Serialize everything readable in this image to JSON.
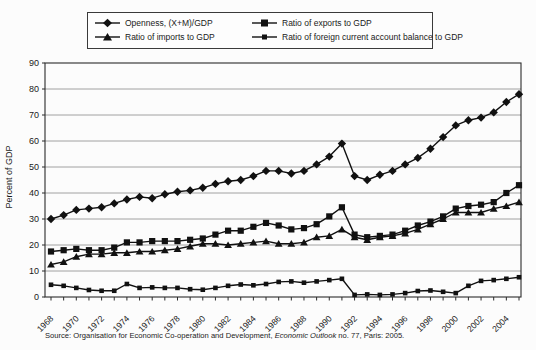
{
  "legend": {
    "items": [
      {
        "label": "Openness, (X+M)/GDP",
        "marker": "diamond"
      },
      {
        "label": "Ratio of exports to GDP",
        "marker": "square"
      },
      {
        "label": "Ratio of imports to GDP",
        "marker": "triangle"
      },
      {
        "label": "Ratio of foreign current account balance to GDP",
        "marker": "small-square"
      }
    ]
  },
  "chart_data": {
    "type": "line",
    "title": "",
    "xlabel": "",
    "ylabel": "Percent of GDP",
    "ylim": [
      0,
      90
    ],
    "ytick_interval": 10,
    "grid": "horizontal",
    "legend_position": "top",
    "line_color": "#111111",
    "grid_color": "#8a8a8a",
    "frame_color": "#2b2b2b",
    "x": [
      1968,
      1969,
      1970,
      1971,
      1972,
      1973,
      1974,
      1975,
      1976,
      1977,
      1978,
      1979,
      1980,
      1981,
      1982,
      1983,
      1984,
      1985,
      1986,
      1987,
      1988,
      1989,
      1990,
      1991,
      1992,
      1993,
      1994,
      1995,
      1996,
      1997,
      1998,
      1999,
      2000,
      2001,
      2002,
      2003,
      2004,
      2005
    ],
    "xtick_labels": [
      "1968",
      "1970",
      "1972",
      "1974",
      "1976",
      "1978",
      "1980",
      "1982",
      "1984",
      "1986",
      "1988",
      "1990",
      "1992",
      "1994",
      "1996",
      "1998",
      "2000",
      "2002",
      "2004"
    ],
    "series": [
      {
        "name": "Openness, (X+M)/GDP",
        "marker": "diamond",
        "color": "#111111",
        "values": [
          30,
          31.5,
          33.5,
          34,
          34.5,
          36,
          37.5,
          38.5,
          38,
          39.5,
          40.5,
          41,
          42,
          43.5,
          44.5,
          45,
          46.5,
          48.5,
          48.5,
          47.5,
          48.5,
          51,
          54,
          59,
          46.5,
          45,
          47,
          48.5,
          51,
          53.5,
          57,
          61.5,
          66,
          68,
          69,
          71,
          75,
          78
        ]
      },
      {
        "name": "Ratio of exports to GDP",
        "marker": "square",
        "color": "#111111",
        "values": [
          17.5,
          18,
          18.5,
          18,
          18,
          19,
          21,
          21,
          21.5,
          21.5,
          21.5,
          22,
          22.5,
          24,
          25.5,
          25.5,
          27,
          28.5,
          27.5,
          26,
          26.5,
          28,
          31,
          34.5,
          24,
          23,
          23.5,
          24,
          25.5,
          27.5,
          29,
          31,
          34,
          35,
          35.5,
          36.5,
          40,
          43
        ]
      },
      {
        "name": "Ratio of imports to GDP",
        "marker": "triangle",
        "color": "#111111",
        "values": [
          12.5,
          13.5,
          15.5,
          16.5,
          16.5,
          17,
          17,
          17.5,
          17.5,
          18,
          18.5,
          19.5,
          20.5,
          20.5,
          20,
          20.5,
          21,
          21.5,
          20.5,
          20.5,
          21,
          23,
          23.5,
          26,
          23,
          22,
          23,
          23.5,
          24.5,
          26,
          28,
          30,
          32.5,
          32.5,
          32.5,
          34,
          35,
          36.5
        ]
      },
      {
        "name": "Ratio of foreign current account balance to GDP",
        "marker": "small-square",
        "color": "#111111",
        "values": [
          4.7,
          4.3,
          3.5,
          2.7,
          2.4,
          2.4,
          5,
          3.5,
          3.7,
          3.5,
          3.5,
          3,
          2.8,
          3.5,
          4.3,
          4.8,
          4.5,
          5,
          5.8,
          6,
          5.5,
          6,
          6.5,
          7,
          0.8,
          1,
          0.8,
          1,
          1.5,
          2.3,
          2.5,
          2,
          1.5,
          4.3,
          6.2,
          6.5,
          7,
          7.6
        ]
      }
    ]
  },
  "source": {
    "prefix": "Source: Organisation for Economic Co-operation and Development, ",
    "italic": "Economic Outlook",
    "suffix": " no. 77, Paris: 2005."
  }
}
